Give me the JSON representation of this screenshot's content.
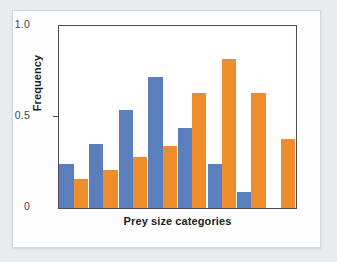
{
  "chart_data": {
    "type": "bar",
    "title": "",
    "xlabel": "Prey size categories",
    "ylabel": "Frequency",
    "categories": [
      "1",
      "2",
      "3",
      "4",
      "5",
      "6",
      "7",
      "8"
    ],
    "ytick_labels": [
      "1.0",
      "0.5",
      "0"
    ],
    "ytick_values": [
      1.0,
      0.5,
      0
    ],
    "ylim": [
      0,
      1.0
    ],
    "grid": false,
    "legend": "none",
    "series": [
      {
        "name": "blue",
        "color": "#5b7fbd",
        "values": [
          0.24,
          0.35,
          0.54,
          0.72,
          0.44,
          0.24,
          0.09,
          0.0
        ]
      },
      {
        "name": "orange",
        "color": "#ef8c2c",
        "values": [
          0.16,
          0.21,
          0.28,
          0.34,
          0.63,
          0.82,
          0.63,
          0.38
        ]
      }
    ]
  }
}
